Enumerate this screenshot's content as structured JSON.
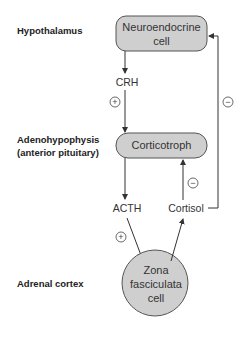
{
  "diagram": {
    "levels": [
      {
        "label_lines": [
          "Hypothalamus"
        ]
      },
      {
        "label_lines": [
          "Adenohypophysis",
          "(anterior pituitary)"
        ]
      },
      {
        "label_lines": [
          "Adrenal cortex"
        ]
      }
    ],
    "nodes": {
      "neuroendocrine": {
        "lines": [
          "Neuroendocrine",
          "cell"
        ]
      },
      "corticotroph": {
        "lines": [
          "Corticotroph"
        ]
      },
      "zona": {
        "lines": [
          "Zona",
          "fasciculata",
          "cell"
        ]
      }
    },
    "signals": {
      "crh": "CRH",
      "acth": "ACTH",
      "cortisol": "Cortisol"
    },
    "effects": {
      "crh_effect": "+",
      "acth_effect": "+",
      "cortisol_pituitary_effect": "−",
      "cortisol_hypothalamus_effect": "−"
    },
    "colors": {
      "node_fill": "#cfcfcf",
      "line": "#333333"
    }
  }
}
